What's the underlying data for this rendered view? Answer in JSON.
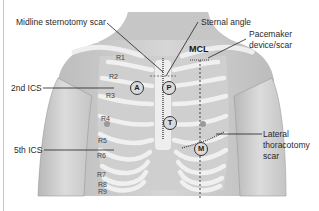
{
  "diagram": {
    "labels": {
      "midline_sternotomy": "Midline sternotomy scar",
      "sternal_angle": "Sternal angle",
      "mcl": "MCL",
      "pacemaker_line1": "Pacemaker",
      "pacemaker_line2": "device/scar",
      "second_ics": "2nd ICS",
      "fifth_ics": "5th ICS",
      "lateral_line1": "Lateral",
      "lateral_line2": "thoracotomy",
      "lateral_line3": "scar"
    },
    "ribs": [
      "R1",
      "R2",
      "R3",
      "R4",
      "R5",
      "R6",
      "R7",
      "R8",
      "R9"
    ],
    "auscultation_areas": [
      {
        "key": "A",
        "name": "Aortic"
      },
      {
        "key": "P",
        "name": "Pulmonic"
      },
      {
        "key": "T",
        "name": "Tricuspid"
      },
      {
        "key": "M",
        "name": "Mitral"
      }
    ],
    "colors": {
      "skin": "#c9c9c9",
      "rib": "#f2f2f2",
      "text": "#2a2a2a",
      "line": "#222222"
    }
  }
}
